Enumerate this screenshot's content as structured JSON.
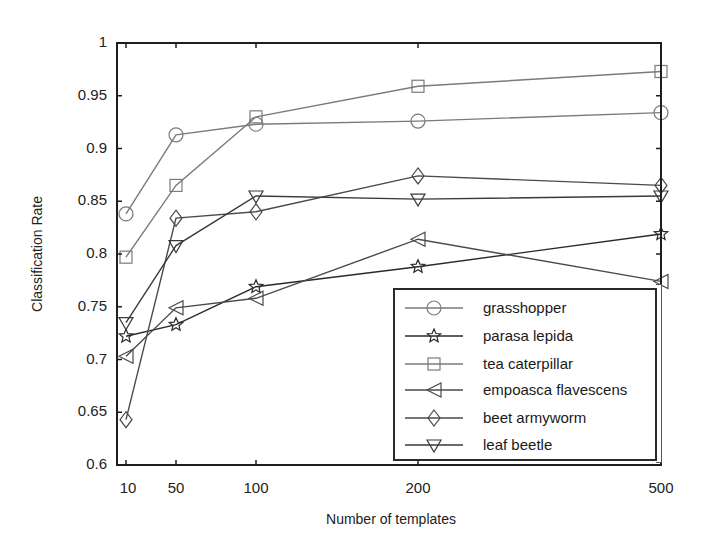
{
  "chart_data": {
    "type": "line",
    "title": "",
    "xlabel": "Number of templates",
    "ylabel": "Classification Rate",
    "x": [
      10,
      50,
      100,
      200,
      500
    ],
    "x_tick_labels": [
      "10",
      "50",
      "100",
      "200",
      "500"
    ],
    "x_tick_pixels": [
      126,
      176,
      256,
      418,
      661
    ],
    "y_tick_labels": [
      "0.6",
      "0.65",
      "0.7",
      "0.75",
      "0.8",
      "0.85",
      "0.9",
      "0.95",
      "1"
    ],
    "y_ticks": [
      0.6,
      0.65,
      0.7,
      0.75,
      0.8,
      0.85,
      0.9,
      0.95,
      1.0
    ],
    "ylim": [
      0.6,
      1.0
    ],
    "grid": false,
    "legend_position": "lower right",
    "series": [
      {
        "name": "grasshopper",
        "marker": "circle",
        "color": "#7a7a7a",
        "values": [
          0.838,
          0.913,
          0.923,
          0.926,
          0.934
        ]
      },
      {
        "name": "parasa lepida",
        "marker": "star",
        "color": "#2a2a2a",
        "values": [
          0.722,
          0.733,
          0.769,
          0.788,
          0.819
        ]
      },
      {
        "name": "tea caterpillar",
        "marker": "square",
        "color": "#7a7a7a",
        "values": [
          0.797,
          0.865,
          0.93,
          0.959,
          0.973
        ]
      },
      {
        "name": "empoasca flavescens",
        "marker": "triangle-left",
        "color": "#4a4a4a",
        "values": [
          0.703,
          0.749,
          0.758,
          0.814,
          0.774
        ]
      },
      {
        "name": "beet armyworm",
        "marker": "diamond",
        "color": "#4a4a4a",
        "values": [
          0.643,
          0.834,
          0.84,
          0.874,
          0.865
        ]
      },
      {
        "name": "leaf beetle",
        "marker": "triangle-down",
        "color": "#3a3a3a",
        "values": [
          0.735,
          0.808,
          0.855,
          0.852,
          0.855
        ]
      }
    ]
  },
  "axes": {
    "xlabel": "Number of templates",
    "ylabel": "Classification Rate"
  },
  "legend": {
    "items": [
      {
        "label": "grasshopper",
        "marker": "circle"
      },
      {
        "label": "parasa lepida",
        "marker": "star"
      },
      {
        "label": "tea caterpillar",
        "marker": "square"
      },
      {
        "label": "empoasca flavescens",
        "marker": "triangle-left"
      },
      {
        "label": "beet armyworm",
        "marker": "diamond"
      },
      {
        "label": "leaf beetle",
        "marker": "triangle-down"
      }
    ]
  }
}
